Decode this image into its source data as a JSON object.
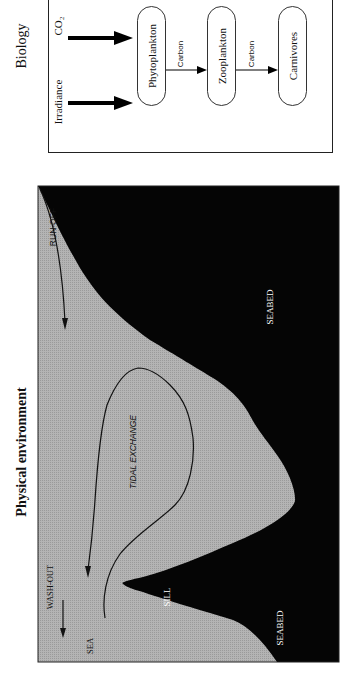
{
  "biology": {
    "title": "Biology",
    "inputs": [
      {
        "label": "Irradiance"
      },
      {
        "label": "CO₂"
      }
    ],
    "nodes": [
      {
        "label": "Phytoplankton"
      },
      {
        "label": "Zooplankton"
      },
      {
        "label": "Carnivores"
      }
    ],
    "flows": [
      {
        "label": "Carbon",
        "from": "Phytoplankton",
        "to": "Zooplankton"
      },
      {
        "label": "Carbon",
        "from": "Zooplankton",
        "to": "Carnivores"
      }
    ]
  },
  "physical": {
    "title": "Physical environment",
    "labels": {
      "run_off": "RUN-OFF",
      "tidal_exchange": "TIDAL EXCHANGE",
      "wash_out": "WASH-OUT",
      "sea": "SEA",
      "sill": "SILL",
      "seabed_upper": "SEABED",
      "seabed_lower": "SEABED"
    },
    "colors": {
      "water": "#b4b4b4",
      "seabed": "#050505"
    }
  }
}
